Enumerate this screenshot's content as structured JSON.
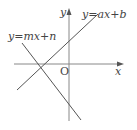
{
  "diagram": {
    "type": "coordinate-plane-with-two-lines",
    "axes": {
      "x_label": "x",
      "y_label": "y",
      "origin_label": "O"
    },
    "lines": [
      {
        "label": "y=ax+b",
        "slope_sign": "positive",
        "y_intercept_sign": "positive"
      },
      {
        "label": "y=mx+n",
        "slope_sign": "negative",
        "y_intercept_sign": "negative"
      }
    ],
    "colors": {
      "axis": "#888888",
      "line": "#555555",
      "text": "#444444"
    }
  }
}
